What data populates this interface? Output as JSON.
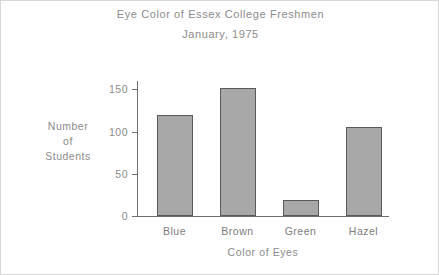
{
  "chart_data": {
    "type": "bar",
    "title": "Eye Color of Essex College Freshmen",
    "subtitle": "January, 1975",
    "xlabel": "Color of Eyes",
    "ylabel_lines": [
      "Number",
      "of",
      "Students"
    ],
    "ylabel": "Number of Students",
    "categories": [
      "Blue",
      "Brown",
      "Green",
      "Hazel"
    ],
    "values": [
      120,
      152,
      19,
      105
    ],
    "ylim": [
      0,
      160
    ],
    "yticks": [
      0,
      50,
      100,
      150
    ],
    "ytick_labels": [
      "0",
      "50",
      "100",
      "150"
    ],
    "grid": false,
    "legend": false,
    "bar_color": "#a8a8a8",
    "bar_edge_color": "#5a5a5a",
    "text_color": "#8c8c8c",
    "axis_color": "#6f6f6f",
    "background_color": "#fefefe"
  }
}
